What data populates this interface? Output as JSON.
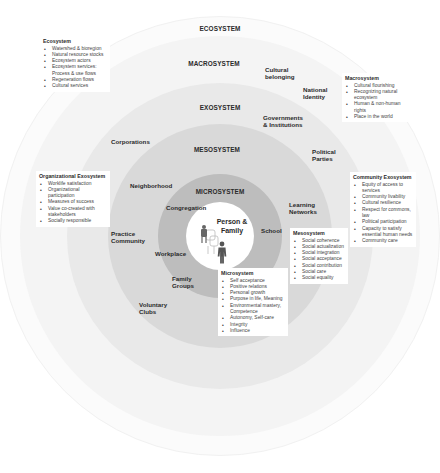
{
  "rings": {
    "ecosystem": "ECOSYSTEM",
    "macrosystem": "MACROSYSTEM",
    "exosystem": "EXOSYSTEM",
    "mesosystem": "MESOSYSTEM",
    "microsystem": "MICROSYSTEM",
    "center": "Person & Family"
  },
  "colors": {
    "ecosystem": "#fbfbfb",
    "macrosystem": "#f4f4f4",
    "exosystem": "#e9e9e9",
    "mesosystem": "#d9d9d9",
    "microsystem": "#bdbdbd",
    "center": "#ffffff"
  },
  "labels": {
    "cultural_belonging": [
      "Cultural",
      "belonging"
    ],
    "national_identity": [
      "National",
      "Identity"
    ],
    "governments": [
      "Governments",
      "& Institutions"
    ],
    "corporations": [
      "Corporations"
    ],
    "political_parties": [
      "Political",
      "Parties"
    ],
    "neighborhood": [
      "Neighborhood"
    ],
    "learning_networks": [
      "Learning",
      "Networks"
    ],
    "congregation": [
      "Congregation"
    ],
    "school": [
      "School"
    ],
    "practice_community": [
      "Practice",
      "Community"
    ],
    "workplace": [
      "Workplace"
    ],
    "family_groups": [
      "Family",
      "Groups"
    ],
    "voluntary_clubs": [
      "Voluntary",
      "Clubs"
    ],
    "person_family": [
      "Person &",
      "Family"
    ]
  },
  "boxes": {
    "ecosystem": {
      "title": "Ecosystem",
      "items": [
        "Watershed & bioregion",
        "Natural resource stocks",
        "Ecosystem actors",
        "Ecosystem services: Process & use flows",
        "Regeneration flows",
        "Cultural services"
      ]
    },
    "macrosystem": {
      "title": "Macrosystem",
      "items": [
        "Cultural flourishing",
        "Recognizing natural ecosystem",
        "Human & non-human rights",
        "Place in the world"
      ]
    },
    "org_exosystem": {
      "title": "Organizational Exosystem",
      "items": [
        "Worklife satisfaction",
        "Organizational participation",
        "Measures of success",
        "Value co-created with stakeholders",
        "Socially responsible"
      ]
    },
    "community_exosystem": {
      "title": "Community Exosystem",
      "items": [
        "Equity of access to services",
        "Community livability",
        "Cultural resilience",
        "Respect for commons, law",
        "Political participation",
        "Capacity to satisfy essential human needs",
        "Community care"
      ]
    },
    "mesosystem": {
      "title": "Mesosystem",
      "items": [
        "Social coherence",
        "Social actualization",
        "Social integration",
        "Social acceptance",
        "Social contribution",
        "Social care",
        "Social equality"
      ]
    },
    "microsystem": {
      "title": "Microsystem",
      "items": [
        "Self acceptance",
        "Positive relations",
        "Personal growth",
        "Purpose in life, Meaning",
        "Environmental mastery, Competence",
        "Autonomy, Self-care",
        "Integrity",
        "Influence"
      ]
    }
  },
  "icons": {
    "center": "people-family-icon"
  }
}
